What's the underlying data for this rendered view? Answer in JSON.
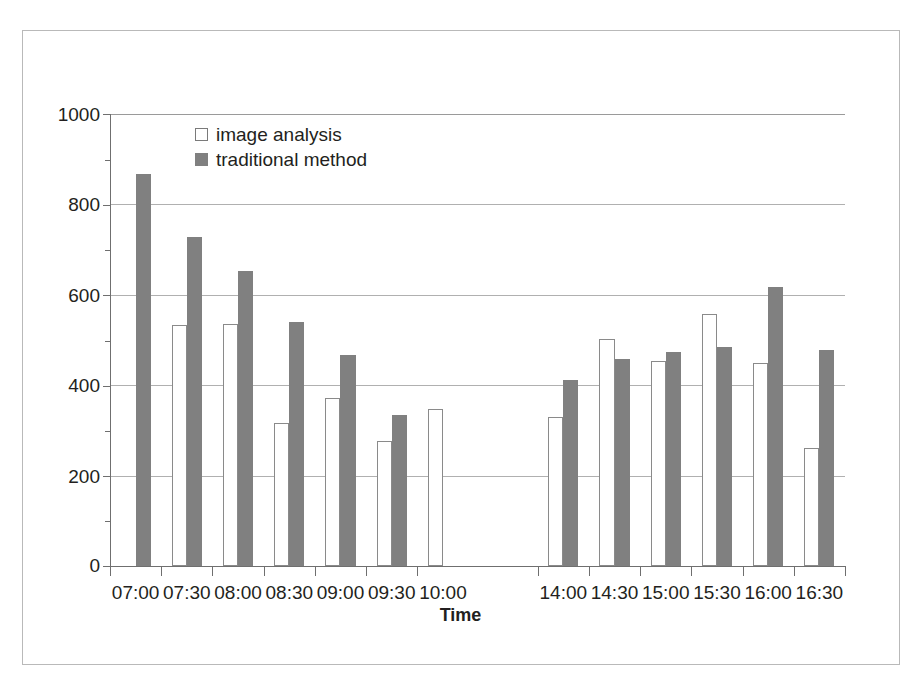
{
  "figure": {
    "background_color": "#ffffff",
    "frame_color": "#b9b9b9"
  },
  "legend": {
    "position": "top-left-inside",
    "entries": [
      {
        "label": "image analysis",
        "swatch": "open-square-icon",
        "color": "#ffffff"
      },
      {
        "label": "traditional method",
        "swatch": "filled-square-icon",
        "color": "#808080"
      }
    ]
  },
  "axes": {
    "y": {
      "title": "Number of people",
      "ticks": [
        "0",
        "200",
        "400",
        "600",
        "800",
        "1000"
      ],
      "min": 0,
      "max": 1000,
      "step": 200
    },
    "x": {
      "title": "Time"
    }
  },
  "chart_data": {
    "type": "bar",
    "title": "",
    "subtitle": "",
    "xlabel": "Time",
    "ylabel": "Number of people",
    "ylim": [
      0,
      1000
    ],
    "ytick_step": 200,
    "grid": true,
    "legend_position": "upper left (inside plot)",
    "categories": [
      "07:00",
      "07:30",
      "08:00",
      "08:30",
      "09:00",
      "09:30",
      "10:00",
      "14:00",
      "14:30",
      "15:00",
      "15:30",
      "16:00",
      "16:30"
    ],
    "series": [
      {
        "name": "image analysis",
        "color": "#ffffff",
        "edge_color": "#8a8a8a",
        "values": [
          null,
          533,
          535,
          317,
          372,
          277,
          348,
          330,
          502,
          453,
          557,
          450,
          261
        ]
      },
      {
        "name": "traditional method",
        "color": "#808080",
        "edge_color": "#808080",
        "values": [
          868,
          728,
          653,
          540,
          466,
          334,
          null,
          412,
          458,
          473,
          484,
          617,
          478
        ]
      }
    ]
  }
}
